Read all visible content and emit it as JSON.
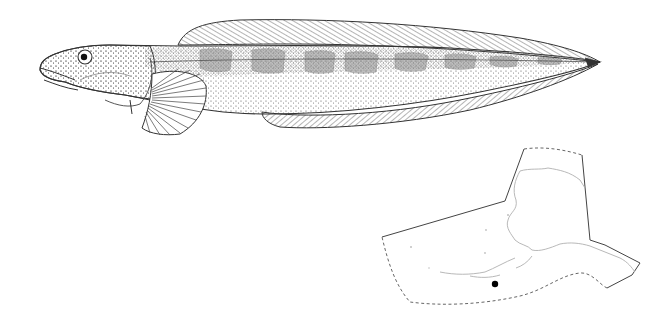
{
  "figure": {
    "description": "Lateral-view stippled line drawing of an elongate eel-like fish (prickleback/blenny form) with a long dorsal fin, fan-shaped pectoral fin, long anal fin and pointed tail; dark blotches along the upper flank.",
    "colors": {
      "ink": "#333333",
      "paper": "#ffffff",
      "blotch": "#8a8a8a",
      "coast": "#b0b0b0"
    }
  },
  "map": {
    "subject": "distribution map",
    "region_outline": "Alaska and adjacent waters (solid land boundary, dashed seaward boundary)",
    "locality_marker": {
      "shape": "filled circle",
      "color": "#000000",
      "position_hint": "south of Alaska Peninsula / Aleutians"
    }
  }
}
